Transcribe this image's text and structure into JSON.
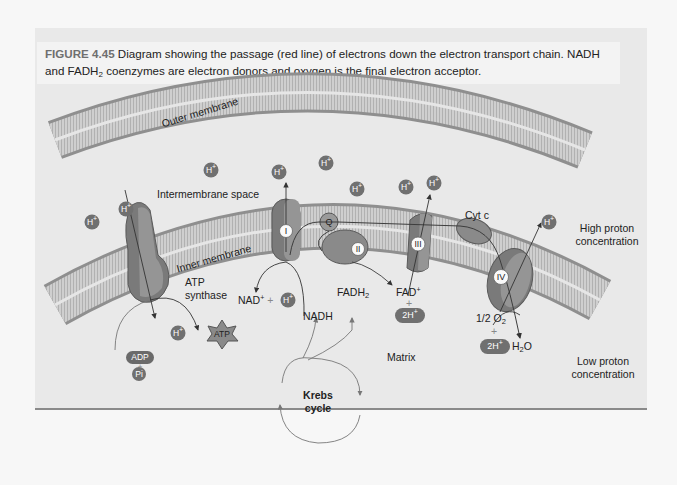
{
  "caption": {
    "figure_label": "FIGURE 4.45",
    "text_line1": "Diagram showing the passage (red line) of electrons down the electron transport chain. NADH",
    "text_line2_a": "and FADH",
    "text_line2_sub": "2",
    "text_line2_b": " coenzymes are electron donors and oxygen is the final electron acceptor."
  },
  "labels": {
    "outer_membrane": "Outer membrane",
    "inner_membrane": "Inner membrane",
    "intermembrane_space": "Intermembrane space",
    "matrix": "Matrix",
    "high_proton": "High proton",
    "high_proton_2": "concentration",
    "low_proton": "Low proton",
    "low_proton_2": "concentration",
    "atp_synthase_1": "ATP",
    "atp_synthase_2": "synthase",
    "cyt_c": "Cyt c",
    "nad_plus": "NAD",
    "nad_plus_sup": "+",
    "plus": "+",
    "nadh": "NADH",
    "fadh2": "FADH",
    "fadh2_sub": "2",
    "fad_plus": "FAD",
    "fad_plus_sup": "+",
    "half_o2": "1/2 O",
    "half_o2_sub": "2",
    "h2o_a": "H",
    "h2o_sub": "2",
    "h2o_b": "O",
    "krebs_1": "Krebs",
    "krebs_2": "cycle"
  },
  "complexes": {
    "I": "I",
    "II": "II",
    "III": "III",
    "IV": "IV",
    "Q": "Q"
  },
  "molecules": {
    "h_plus": "H",
    "h_plus_sup": "+",
    "two_h_plus": "2H",
    "atp": "ATP",
    "adp": "ADP",
    "pi": "Pi"
  },
  "colors": {
    "panel_bg": "#e9e9e9",
    "membrane_head": "#8f8f8f",
    "membrane_body": "#c8c8c8",
    "protein_dark": "#6e6e6e",
    "protein_mid": "#8c8c8c",
    "ion_fill": "#707070",
    "text": "#222222",
    "figure_label": "#6f6f6f"
  }
}
